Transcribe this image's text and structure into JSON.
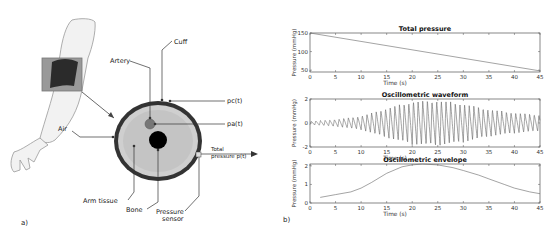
{
  "panel_a": {
    "label": "a)",
    "labels": {
      "cuff": "Cuff",
      "artery": "Artery",
      "pc": "pc(t)",
      "pa": "pa(t)",
      "air": "Air",
      "total_line1": "Total",
      "total_line2": "pressure p(t)",
      "arm_tissue": "Arm tissue",
      "bone": "Bone",
      "sensor_line1": "Pressure",
      "sensor_line2": "sensor"
    }
  },
  "panel_b": {
    "label": "b)"
  },
  "chart_data": [
    {
      "type": "line",
      "title": "Total pressure",
      "xlabel": "Time (s)",
      "ylabel": "Pressure (mmHg)",
      "xlim": [
        0,
        45
      ],
      "ylim": [
        45,
        150
      ],
      "xticks": [
        0,
        5,
        10,
        15,
        20,
        25,
        30,
        35,
        40,
        45
      ],
      "yticks": [
        50,
        100,
        150
      ],
      "x": [
        0,
        45
      ],
      "values": [
        150,
        48
      ],
      "grid": false
    },
    {
      "type": "line",
      "title": "Oscillometric waveform",
      "xlabel": "Time (s)",
      "ylabel": "Pressure (mmHg)",
      "xlim": [
        0,
        45
      ],
      "ylim": [
        -2,
        2
      ],
      "xticks": [
        0,
        5,
        10,
        15,
        20,
        25,
        30,
        35,
        40,
        45
      ],
      "yticks": [
        -2,
        0,
        2
      ],
      "description": "Pulsatile oscillation (~1 Hz) with amplitude growing from ~0.1 at t=0 to max ~2 near t=20-25 s, then decaying to ~0.7 at t=45 s",
      "envelope_x": [
        0,
        5,
        10,
        15,
        20,
        25,
        30,
        35,
        40,
        45
      ],
      "envelope_amplitude": [
        0.15,
        0.3,
        0.6,
        1.3,
        1.9,
        2.0,
        1.7,
        1.2,
        0.9,
        0.7
      ],
      "grid": false
    },
    {
      "type": "line",
      "title": "Oscillometric envelope",
      "xlabel": "Time (s)",
      "ylabel": "Pressure (mmHg)",
      "xlim": [
        0,
        45
      ],
      "ylim": [
        0,
        2.1
      ],
      "xticks": [
        0,
        5,
        10,
        15,
        20,
        25,
        30,
        35,
        40,
        45
      ],
      "yticks": [
        0,
        1,
        2
      ],
      "x": [
        2,
        5,
        8,
        10,
        12,
        15,
        18,
        20,
        22,
        25,
        28,
        30,
        33,
        35,
        38,
        40,
        43,
        45
      ],
      "values": [
        0.3,
        0.45,
        0.6,
        0.8,
        1.1,
        1.6,
        1.95,
        2.05,
        2.1,
        2.05,
        1.9,
        1.75,
        1.5,
        1.3,
        1.0,
        0.8,
        0.6,
        0.5
      ],
      "grid": false
    }
  ]
}
